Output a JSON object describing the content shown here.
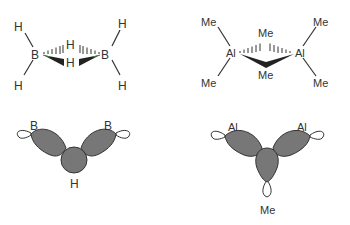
{
  "diagram": {
    "type": "chemical-structures",
    "panels": [
      {
        "id": "diborane-structure",
        "atoms": {
          "b_left": "B",
          "b_right": "B",
          "h_tl": "H",
          "h_bl": "H",
          "h_tr": "H",
          "h_br": "H",
          "h_bridge_top": "H",
          "h_bridge_bottom": "H"
        }
      },
      {
        "id": "trimethylaluminium-dimer-structure",
        "atoms": {
          "al_left": "Al",
          "al_right": "Al",
          "me_tl": "Me",
          "me_bl": "Me",
          "me_tr": "Me",
          "me_br": "Me",
          "me_bridge_top": "Me",
          "me_bridge_bottom": "Me"
        }
      },
      {
        "id": "diborane-orbital-overlap",
        "labels": {
          "left": "B",
          "right": "B",
          "center": "H"
        }
      },
      {
        "id": "aluminium-methyl-orbital-overlap",
        "labels": {
          "left": "Al",
          "right": "Al",
          "center": "Me"
        }
      }
    ],
    "colors": {
      "ink": "#333333",
      "lobe_fill": "#7a7a7a",
      "bond_highlight": "#3c8a3c"
    }
  }
}
